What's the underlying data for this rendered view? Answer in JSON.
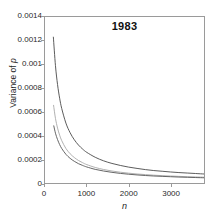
{
  "chart_data": {
    "type": "line",
    "title": "1983",
    "xlabel": "n",
    "ylabel_prefix": "Variance of ",
    "ylabel_symbol": "p",
    "xlim": [
      0,
      3800
    ],
    "ylim": [
      0,
      0.0014
    ],
    "grid": false,
    "legend": "none",
    "xticks": [
      0,
      1000,
      2000,
      3000
    ],
    "xtick_labels": [
      "0",
      "1000",
      "2000",
      "3000"
    ],
    "yticks": [
      0,
      0.0002,
      0.0004,
      0.0006,
      0.0008,
      0.001,
      0.0012,
      0.0014
    ],
    "ytick_labels": [
      "0",
      "0.0002",
      "0.0004",
      "0.0006",
      "0.0008",
      "0.001",
      "0.0012",
      "0.0014"
    ],
    "series": [
      {
        "name": "upper-curve",
        "color": "#4a4a4a",
        "x": [
          200,
          250,
          300,
          350,
          400,
          500,
          600,
          700,
          800,
          900,
          1000,
          1200,
          1400,
          1600,
          1800,
          2000,
          2200,
          2400,
          2600,
          2800,
          3000,
          3200,
          3400,
          3600,
          3800
        ],
        "y": [
          0.00123,
          0.00099,
          0.00083,
          0.000715,
          0.000628,
          0.000505,
          0.000424,
          0.000365,
          0.00032,
          0.000286,
          0.000258,
          0.000217,
          0.000187,
          0.000165,
          0.000148,
          0.000134,
          0.000123,
          0.000113,
          0.000105,
          9.9e-05,
          9.3e-05,
          8.8e-05,
          8.4e-05,
          8e-05,
          7.6e-05
        ]
      },
      {
        "name": "middle-curve",
        "color": "#a8a8a8",
        "x": [
          205,
          250,
          300,
          350,
          400,
          500,
          600,
          700,
          800,
          900,
          1000,
          1200,
          1400,
          1600,
          1800,
          2000,
          2200,
          2400,
          2600,
          2800,
          3000,
          3200,
          3400,
          3600,
          3800
        ],
        "y": [
          0.000655,
          0.000545,
          0.000463,
          0.000403,
          0.000357,
          0.000291,
          0.000247,
          0.000215,
          0.00019,
          0.000171,
          0.000155,
          0.000131,
          0.000114,
          0.000101,
          9.1e-05,
          8.3e-05,
          7.6e-05,
          7.1e-05,
          6.6e-05,
          6.2e-05,
          5.9e-05,
          5.6e-05,
          5.3e-05,
          5.1e-05,
          4.9e-05
        ]
      },
      {
        "name": "lower-curve",
        "color": "#565656",
        "x": [
          210,
          250,
          300,
          350,
          400,
          500,
          600,
          700,
          800,
          900,
          1000,
          1200,
          1400,
          1600,
          1800,
          2000,
          2200,
          2400,
          2600,
          2800,
          3000,
          3200,
          3400,
          3600,
          3800
        ],
        "y": [
          0.000482,
          0.00042,
          0.000366,
          0.000324,
          0.000291,
          0.000242,
          0.000208,
          0.000183,
          0.000163,
          0.000148,
          0.000135,
          0.000115,
          0.000101,
          9e-05,
          8.1e-05,
          7.4e-05,
          6.8e-05,
          6.3e-05,
          5.9e-05,
          5.6e-05,
          5.3e-05,
          5e-05,
          4.8e-05,
          4.6e-05,
          4.4e-05
        ]
      }
    ]
  }
}
